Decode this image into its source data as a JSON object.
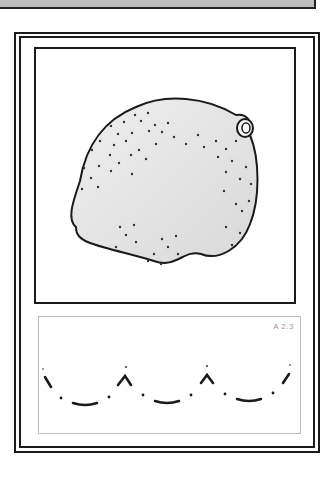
{
  "card": {
    "code_label": "A 2.3",
    "image_subject": "lemon",
    "tracing_pattern": "dotted-scallop-arcs",
    "colors": {
      "border": "#1a1a1a",
      "fruit_fill": "#e4e4e4",
      "trace_box_border": "#bdbdbd",
      "code_text": "#9a9a9a"
    }
  }
}
